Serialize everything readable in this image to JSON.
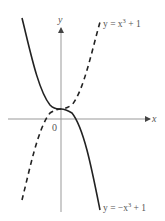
{
  "figure": {
    "axes": {
      "x_label": "x",
      "y_label": "y",
      "origin_label": "0"
    },
    "curves": [
      {
        "name": "y = x^3 + 1",
        "label_prefix": "y = x",
        "label_exp": "3",
        "label_suffix": " + 1",
        "style": "dashed"
      },
      {
        "name": "y = -x^3 + 1",
        "label_prefix": "y = −x",
        "label_exp": "3",
        "label_suffix": " + 1",
        "style": "solid"
      }
    ],
    "colors": {
      "curve": "#222222",
      "axis": "#888888",
      "text": "#555555"
    }
  }
}
